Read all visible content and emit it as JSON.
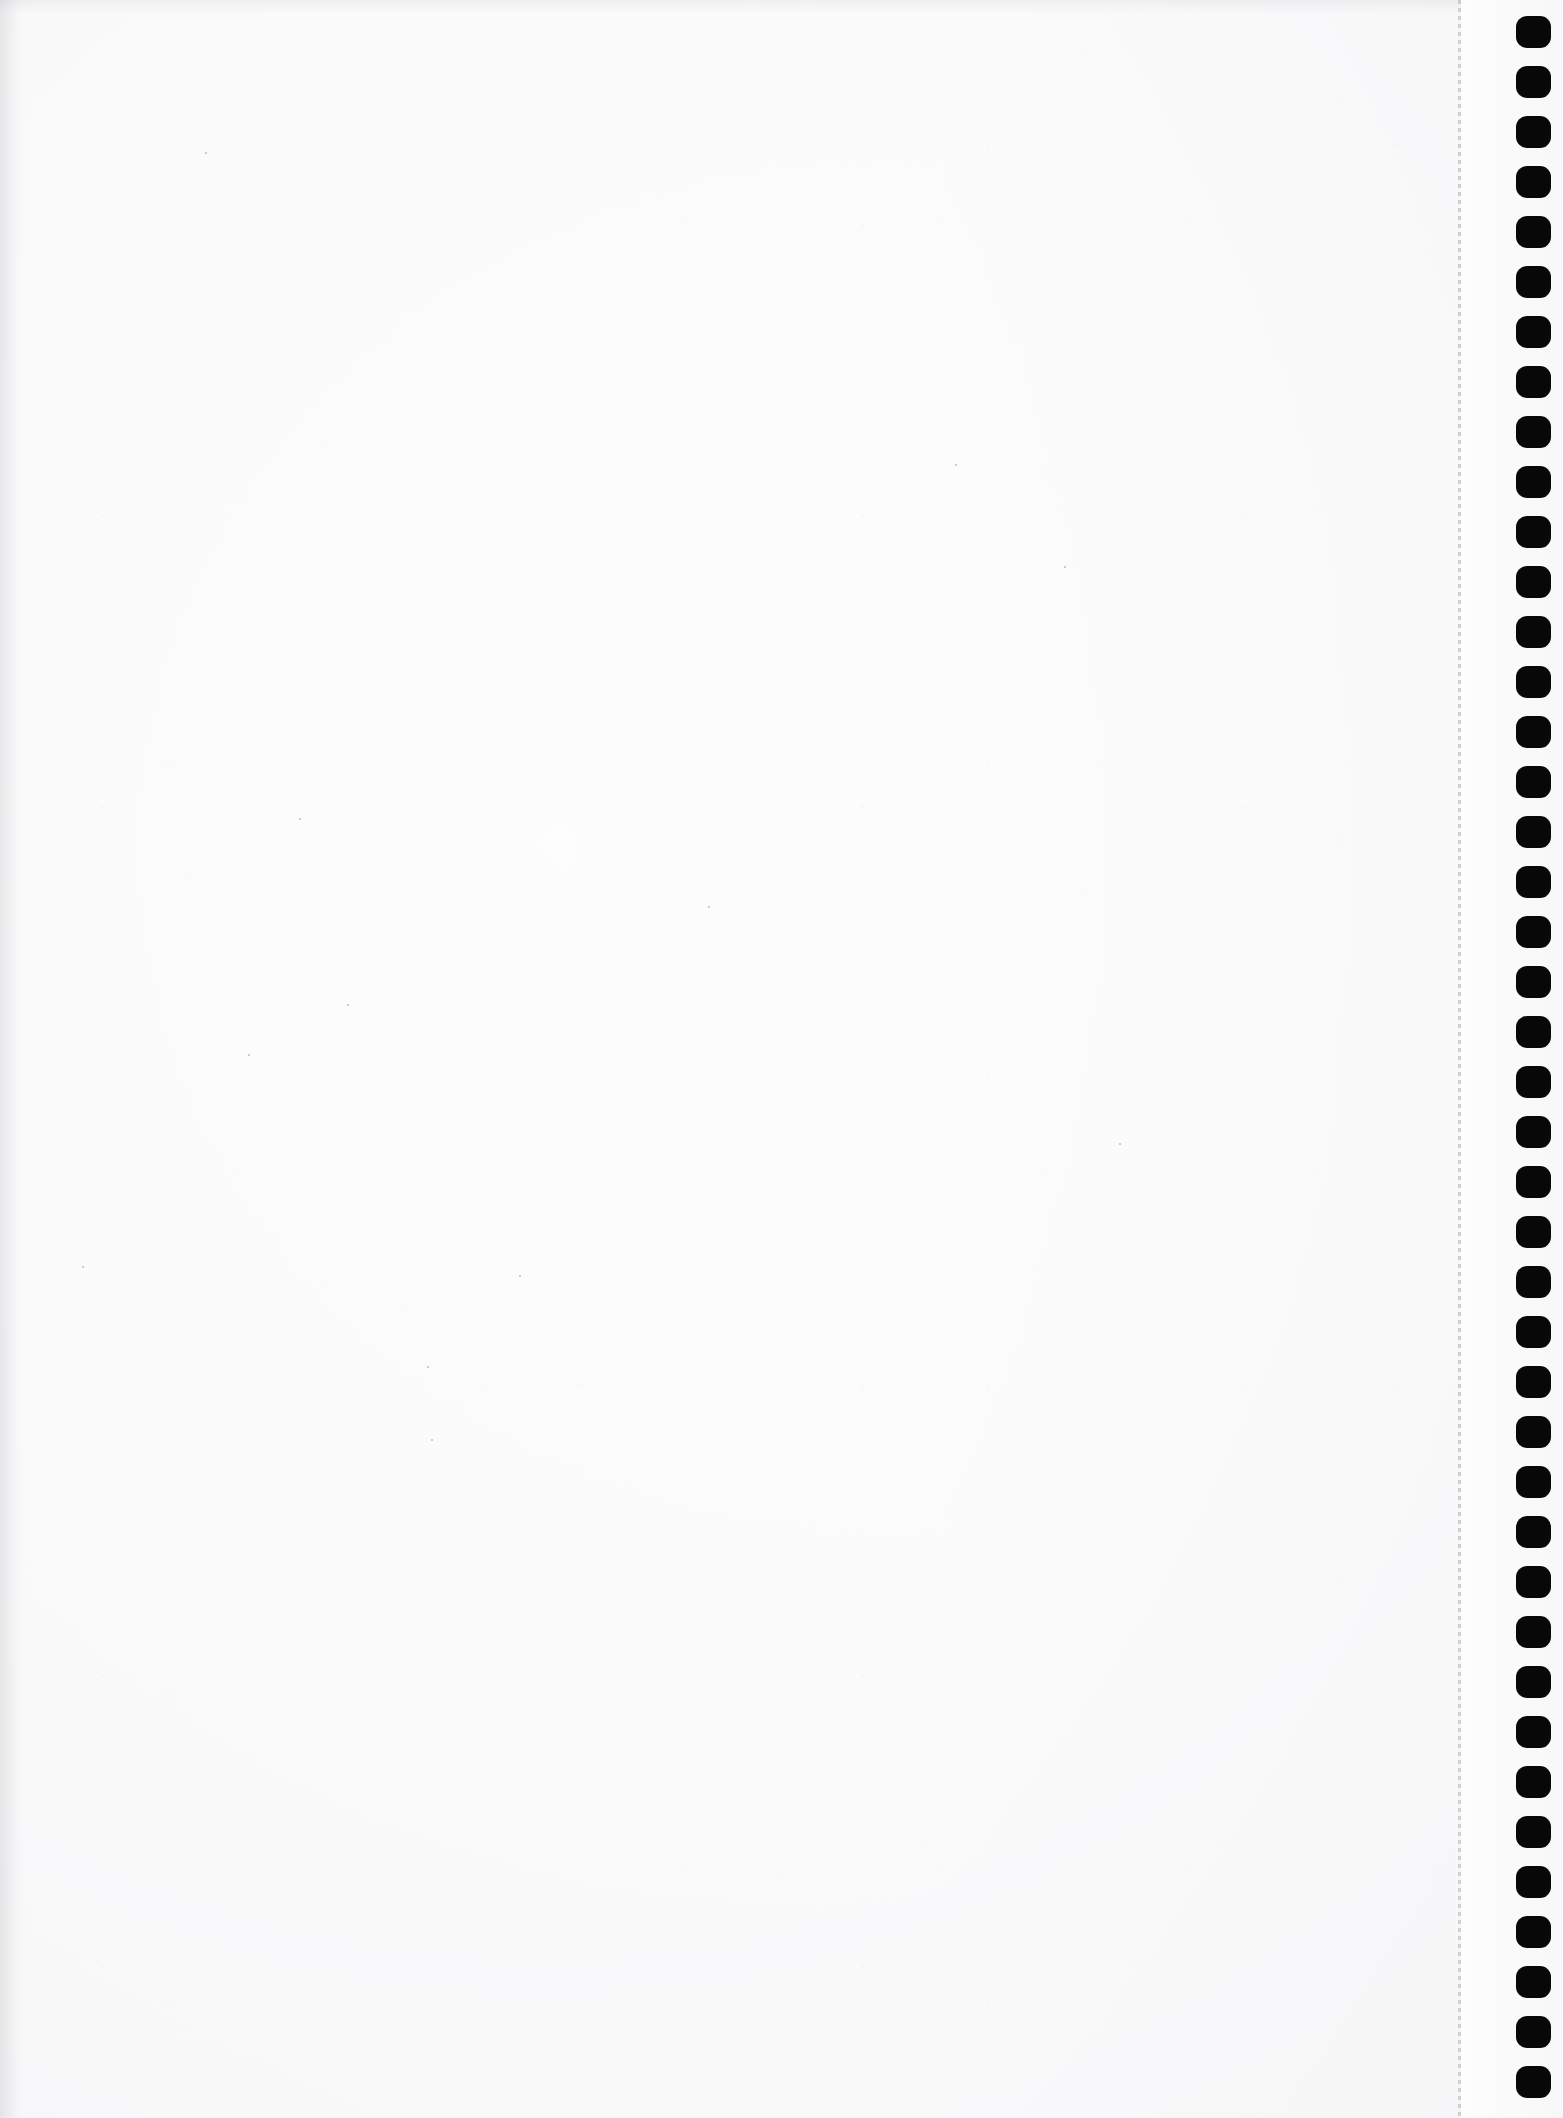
{
  "document": {
    "kind": "scanned-blank-page",
    "description": "Blank scanned sheet of continuous tractor-feed computer paper",
    "page_width": 1563,
    "page_height": 2118,
    "text_content": "",
    "visible_text": []
  },
  "colors": {
    "paper": "#fbfbfc",
    "paper_highlight": "#ffffff",
    "paper_shadow": "#f6f6f7",
    "sprocket_hole": "#080808",
    "perforation": "#9696a0"
  },
  "perforation": {
    "name": "tear-off-perforation",
    "x": 1458,
    "dash_length": 4,
    "gap_length": 4,
    "width": 3
  },
  "tractor_strip": {
    "name": "tractor-feed-strip",
    "x": 1461,
    "width": 102
  },
  "sprockets": {
    "name": "sprocket-feed-holes",
    "count": 42,
    "x": 1516,
    "width": 35,
    "height": 32,
    "first_y": 16,
    "pitch": 50,
    "corner_radius": 11
  },
  "specks": [
    {
      "x": 205,
      "y": 152
    },
    {
      "x": 299,
      "y": 818
    },
    {
      "x": 347,
      "y": 1004
    },
    {
      "x": 427,
      "y": 1366
    },
    {
      "x": 519,
      "y": 1275
    },
    {
      "x": 708,
      "y": 906
    },
    {
      "x": 955,
      "y": 464
    },
    {
      "x": 1064,
      "y": 566
    },
    {
      "x": 248,
      "y": 1054
    },
    {
      "x": 82,
      "y": 1266
    },
    {
      "x": 431,
      "y": 1439
    },
    {
      "x": 1119,
      "y": 1143
    }
  ]
}
